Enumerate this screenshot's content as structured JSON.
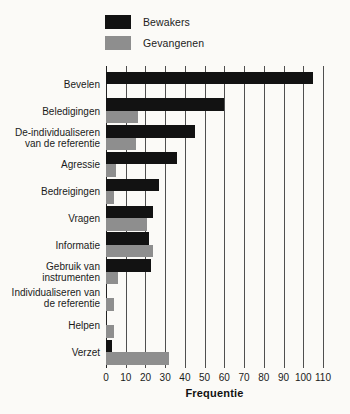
{
  "chart_data": {
    "type": "bar",
    "orientation": "horizontal",
    "categories": [
      "Bevelen",
      "Beledigingen",
      "De-individualiseren van de referentie",
      "Agressie",
      "Bedreigingen",
      "Vragen",
      "Informatie",
      "Gebruik van instrumenten",
      "Individualiseren van de referentie",
      "Helpen",
      "Verzet"
    ],
    "series": [
      {
        "name": "Bewakers",
        "color": "#121212",
        "values": [
          105,
          60,
          45,
          36,
          27,
          24,
          22,
          23,
          0,
          0,
          3
        ]
      },
      {
        "name": "Gevangenen",
        "color": "#8e8e8e",
        "values": [
          0,
          16,
          15,
          5,
          4,
          21,
          24,
          6,
          4,
          4,
          32
        ]
      }
    ],
    "xlabel": "Frequentie",
    "xlim": [
      0,
      110
    ],
    "xticks": [
      0,
      10,
      20,
      30,
      40,
      50,
      60,
      70,
      80,
      90,
      100,
      110
    ],
    "grid": true,
    "legend_position": "top-left",
    "colors": {
      "bar_black": "#121212",
      "bar_gray": "#8e8e8e",
      "gridline": "#4f4f4f",
      "background": "#fbfaf7",
      "text": "#1a1a1a"
    }
  }
}
